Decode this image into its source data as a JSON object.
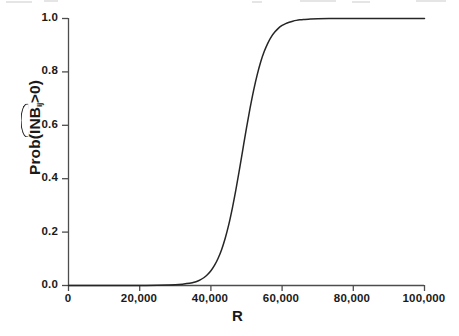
{
  "chart_data": {
    "type": "line",
    "title": "",
    "subtitle": "",
    "xlabel": "R",
    "ylabel": "Prob(INB̂ᵢⱼ>0)",
    "ylabel_parts": {
      "prefix": "Prob(",
      "hatted": "INB",
      "subscript": "ij",
      "suffix": ">0)"
    },
    "xlim": [
      0,
      100000
    ],
    "ylim": [
      0,
      1.0
    ],
    "grid": false,
    "legend": null,
    "legend_position": "none",
    "line_color": "#262626",
    "background_color": "#ffffff",
    "axis_color": "#4d4d4d",
    "xticks": [
      0,
      20000,
      40000,
      60000,
      80000,
      100000
    ],
    "xtick_labels": [
      "0",
      "20,000",
      "40,000",
      "60,000",
      "80,000",
      "100,000"
    ],
    "yticks": [
      0.0,
      0.2,
      0.4,
      0.6,
      0.8,
      1.0
    ],
    "ytick_labels": [
      "0.0",
      "0.2",
      "0.4",
      "0.6",
      "0.8",
      "1.0"
    ],
    "series": [
      {
        "name": "Prob(INB>0)",
        "x": [
          0,
          5000,
          10000,
          15000,
          20000,
          25000,
          28000,
          30000,
          32000,
          34000,
          35000,
          36000,
          37000,
          38000,
          39000,
          40000,
          41000,
          42000,
          43000,
          44000,
          45000,
          46000,
          47000,
          48000,
          49000,
          50000,
          51000,
          52000,
          53000,
          54000,
          55000,
          56000,
          57000,
          58000,
          59000,
          60000,
          61000,
          62000,
          63000,
          64000,
          65000,
          66000,
          68000,
          70000,
          75000,
          80000,
          85000,
          90000,
          95000,
          100000
        ],
        "y": [
          0.0,
          0.0,
          0.0,
          0.0,
          0.0,
          0.001,
          0.002,
          0.003,
          0.005,
          0.008,
          0.011,
          0.015,
          0.021,
          0.029,
          0.04,
          0.055,
          0.075,
          0.101,
          0.134,
          0.176,
          0.227,
          0.288,
          0.357,
          0.433,
          0.512,
          0.59,
          0.664,
          0.731,
          0.789,
          0.838,
          0.877,
          0.908,
          0.932,
          0.95,
          0.964,
          0.974,
          0.981,
          0.986,
          0.99,
          0.993,
          0.995,
          0.996,
          0.998,
          0.999,
          1.0,
          1.0,
          1.0,
          1.0,
          1.0,
          1.0
        ]
      }
    ],
    "annotations": {
      "midpoint_x": 50000,
      "midpoint_y": 0.5,
      "takeoff_x": 35000,
      "plateau_x": 65000
    }
  }
}
